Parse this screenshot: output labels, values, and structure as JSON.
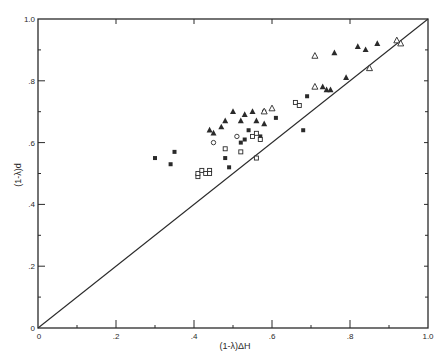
{
  "chart_data": {
    "type": "scatter",
    "title": "",
    "xlabel": "(1-λ)ΔH",
    "ylabel": "(1-λ)d",
    "xlim": [
      0,
      1.0
    ],
    "ylim": [
      0,
      1.0
    ],
    "grid": false,
    "legend": "none",
    "x_ticks": [
      {
        "value": 0,
        "label": "0"
      },
      {
        "value": 0.2,
        "label": ".2"
      },
      {
        "value": 0.4,
        "label": ".4"
      },
      {
        "value": 0.6,
        "label": ".6"
      },
      {
        "value": 0.8,
        "label": ".8"
      },
      {
        "value": 1.0,
        "label": "1.0"
      }
    ],
    "y_ticks": [
      {
        "value": 0,
        "label": "0"
      },
      {
        "value": 0.2,
        "label": ".2"
      },
      {
        "value": 0.4,
        "label": ".4"
      },
      {
        "value": 0.6,
        "label": ".6"
      },
      {
        "value": 0.8,
        "label": ".8"
      },
      {
        "value": 1.0,
        "label": "1.0"
      }
    ],
    "reference_line": {
      "label": "y = x",
      "from": [
        0,
        0
      ],
      "to": [
        1,
        1
      ]
    },
    "series": [
      {
        "name": "filled-square",
        "marker": "square-filled",
        "points": [
          [
            0.3,
            0.55
          ],
          [
            0.34,
            0.53
          ],
          [
            0.35,
            0.57
          ],
          [
            0.48,
            0.55
          ],
          [
            0.49,
            0.52
          ],
          [
            0.52,
            0.6
          ],
          [
            0.53,
            0.61
          ],
          [
            0.54,
            0.64
          ],
          [
            0.57,
            0.62
          ],
          [
            0.58,
            0.7
          ],
          [
            0.61,
            0.68
          ],
          [
            0.68,
            0.64
          ],
          [
            0.69,
            0.75
          ]
        ]
      },
      {
        "name": "open-square",
        "marker": "square-open",
        "points": [
          [
            0.41,
            0.49
          ],
          [
            0.41,
            0.5
          ],
          [
            0.42,
            0.51
          ],
          [
            0.43,
            0.5
          ],
          [
            0.44,
            0.51
          ],
          [
            0.44,
            0.5
          ],
          [
            0.48,
            0.58
          ],
          [
            0.52,
            0.57
          ],
          [
            0.55,
            0.62
          ],
          [
            0.56,
            0.63
          ],
          [
            0.56,
            0.55
          ],
          [
            0.57,
            0.61
          ],
          [
            0.66,
            0.73
          ],
          [
            0.67,
            0.72
          ]
        ]
      },
      {
        "name": "open-circle",
        "marker": "circle-open",
        "points": [
          [
            0.45,
            0.6
          ],
          [
            0.51,
            0.62
          ]
        ]
      },
      {
        "name": "filled-triangle",
        "marker": "triangle-filled",
        "points": [
          [
            0.44,
            0.64
          ],
          [
            0.45,
            0.63
          ],
          [
            0.47,
            0.65
          ],
          [
            0.48,
            0.67
          ],
          [
            0.5,
            0.7
          ],
          [
            0.52,
            0.67
          ],
          [
            0.53,
            0.69
          ],
          [
            0.55,
            0.7
          ],
          [
            0.56,
            0.67
          ],
          [
            0.58,
            0.66
          ],
          [
            0.73,
            0.78
          ],
          [
            0.74,
            0.77
          ],
          [
            0.75,
            0.77
          ],
          [
            0.76,
            0.89
          ],
          [
            0.79,
            0.81
          ],
          [
            0.82,
            0.91
          ],
          [
            0.84,
            0.9
          ],
          [
            0.87,
            0.92
          ]
        ]
      },
      {
        "name": "open-triangle",
        "marker": "triangle-open",
        "points": [
          [
            0.58,
            0.7
          ],
          [
            0.6,
            0.71
          ],
          [
            0.71,
            0.88
          ],
          [
            0.71,
            0.78
          ],
          [
            0.85,
            0.84
          ],
          [
            0.92,
            0.93
          ],
          [
            0.93,
            0.92
          ]
        ]
      }
    ]
  },
  "colors": {
    "ink": "#2a2a2a",
    "background": "#ffffff"
  }
}
